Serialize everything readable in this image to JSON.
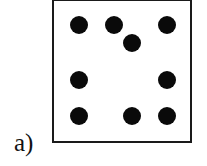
{
  "figure": {
    "label": "a)",
    "box": {
      "border_color": "#1a1a1a",
      "background": "#ffffff"
    },
    "dot_color": "#0a0a0a",
    "dots": [
      {
        "x": 79,
        "y": 25
      },
      {
        "x": 114,
        "y": 25
      },
      {
        "x": 167,
        "y": 25
      },
      {
        "x": 132,
        "y": 43
      },
      {
        "x": 79,
        "y": 80
      },
      {
        "x": 167,
        "y": 80
      },
      {
        "x": 79,
        "y": 116
      },
      {
        "x": 132,
        "y": 116
      },
      {
        "x": 167,
        "y": 116
      }
    ],
    "dot_count": 9
  }
}
